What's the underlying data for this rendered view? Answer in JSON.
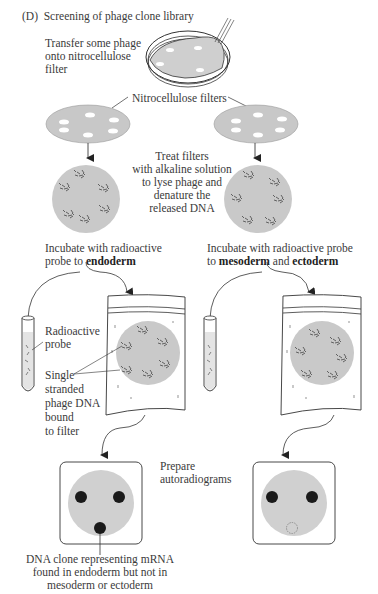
{
  "panel": {
    "label": "(D)",
    "title": "Screening of phage clone library"
  },
  "steps": {
    "transfer": [
      "Transfer some phage",
      "onto nitrocellulose",
      "filter"
    ],
    "filters_label": "Nitrocellulose filters",
    "treat": [
      "Treat filters",
      "with alkaline solution",
      "to lyse  phage and",
      "denature the",
      "released DNA"
    ],
    "incubate_left": {
      "line1": "Incubate with radioactive",
      "line2_prefix": "probe to ",
      "line2_bold": "endoderm"
    },
    "incubate_right": {
      "line1": "Incubate with radioactive probe",
      "line2_prefix": "to ",
      "bold1": "mesoderm",
      "mid": " and ",
      "bold2": "ectoderm"
    },
    "probe_label": [
      "Radioactive",
      "probe"
    ],
    "ssdna_label": [
      "Single",
      "stranded",
      "phage DNA",
      "bound",
      "to filter"
    ],
    "autoradiograms": [
      "Prepare",
      "autoradiograms"
    ],
    "result_caption": [
      "DNA clone representing  mRNA",
      "found in endoderm but not in",
      "mesoderm or ectoderm"
    ]
  },
  "colors": {
    "filter_gray": "#c8c8c8",
    "disk_gray": "#d0d0d0",
    "spot_black": "#1a1a1a",
    "line": "#333333"
  }
}
